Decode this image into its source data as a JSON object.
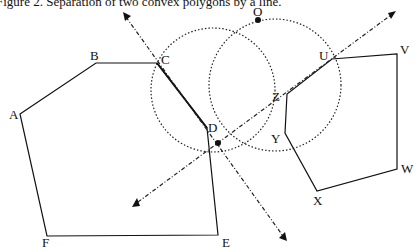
{
  "caption_clipped": "Figure 2. Separation of two convex polygons by a line.",
  "figure": {
    "polygon_left": {
      "labels": [
        "A",
        "B",
        "C",
        "D",
        "E",
        "F"
      ],
      "points": [
        [
          20,
          114
        ],
        [
          96,
          63
        ],
        [
          157,
          63
        ],
        [
          207,
          128
        ],
        [
          218,
          235
        ],
        [
          47,
          236
        ]
      ]
    },
    "polygon_right": {
      "labels": [
        "U",
        "V",
        "W",
        "X",
        "Y",
        "Z"
      ],
      "points": [
        [
          332,
          59
        ],
        [
          397,
          54
        ],
        [
          397,
          169
        ],
        [
          317,
          191
        ],
        [
          285,
          133
        ],
        [
          287,
          94
        ]
      ]
    },
    "points": {
      "O": {
        "label": "O",
        "x": 258,
        "y": 20
      },
      "P": {
        "label": "",
        "x": 218,
        "y": 143
      }
    },
    "circles": [
      {
        "cx": 213,
        "cy": 90,
        "r": 62
      },
      {
        "cx": 275,
        "cy": 85,
        "r": 66
      }
    ],
    "lines": [
      {
        "name": "line-CD",
        "from": [
          123,
          13
        ],
        "to": [
          286,
          240
        ]
      },
      {
        "name": "line-PU",
        "from": [
          134,
          205
        ],
        "to": [
          395,
          12
        ]
      }
    ],
    "vertex_labels": {
      "A": "A",
      "B": "B",
      "C": "C",
      "D": "D",
      "E": "E",
      "F": "F",
      "U": "U",
      "V": "V",
      "W": "W",
      "X": "X",
      "Y": "Y",
      "Z": "Z",
      "O": "O"
    }
  }
}
